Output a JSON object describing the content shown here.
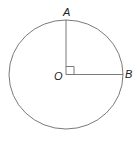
{
  "diagram": {
    "type": "circle-with-radii",
    "center_label": "O",
    "points": [
      {
        "label": "A",
        "position": "top"
      },
      {
        "label": "B",
        "position": "right"
      }
    ],
    "right_angle_at": "O",
    "stroke_color": "#6b6b6b"
  }
}
